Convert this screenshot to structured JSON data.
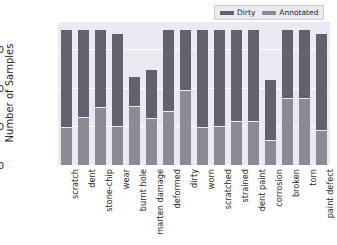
{
  "chart_data": {
    "type": "bar",
    "stacked": true,
    "title": "",
    "xlabel": "",
    "ylabel": "Number of Samples",
    "ylim": [
      0,
      3700
    ],
    "yticks": [
      0,
      1000,
      2000,
      3000
    ],
    "ytick_labels": [
      "0",
      "1000",
      "2000",
      "3000"
    ],
    "grid": true,
    "legend_position": "upper right",
    "categories": [
      "scratch",
      "dent",
      "stone-chip",
      "wear",
      "burnt hole",
      "marten damage",
      "deformed",
      "dirty",
      "worn",
      "scratched",
      "strained",
      "dent paint",
      "corrosion",
      "broken",
      "torn",
      "paint defect"
    ],
    "series": [
      {
        "name": "Dirty",
        "color": "#62626e",
        "values": [
          3500,
          3500,
          3500,
          3400,
          2280,
          2460,
          3500,
          3500,
          3500,
          3500,
          3500,
          3500,
          2200,
          3500,
          3500,
          3380
        ]
      },
      {
        "name": "Annotated",
        "color": "#8b8b96",
        "values": [
          950,
          1220,
          1480,
          990,
          1510,
          1190,
          1380,
          1920,
          950,
          980,
          1120,
          1120,
          630,
          1710,
          1710,
          880
        ]
      }
    ]
  },
  "legend": {
    "entries": [
      {
        "label": "Dirty",
        "color": "#62626e"
      },
      {
        "label": "Annotated",
        "color": "#8b8b96"
      }
    ]
  },
  "axes": {
    "y_axis_label": "Number of Samples"
  },
  "colors": {
    "plot_background": "#eaeaf2",
    "grid": "#ffffff",
    "text": "#262626",
    "figure_background": "#ffffff"
  }
}
